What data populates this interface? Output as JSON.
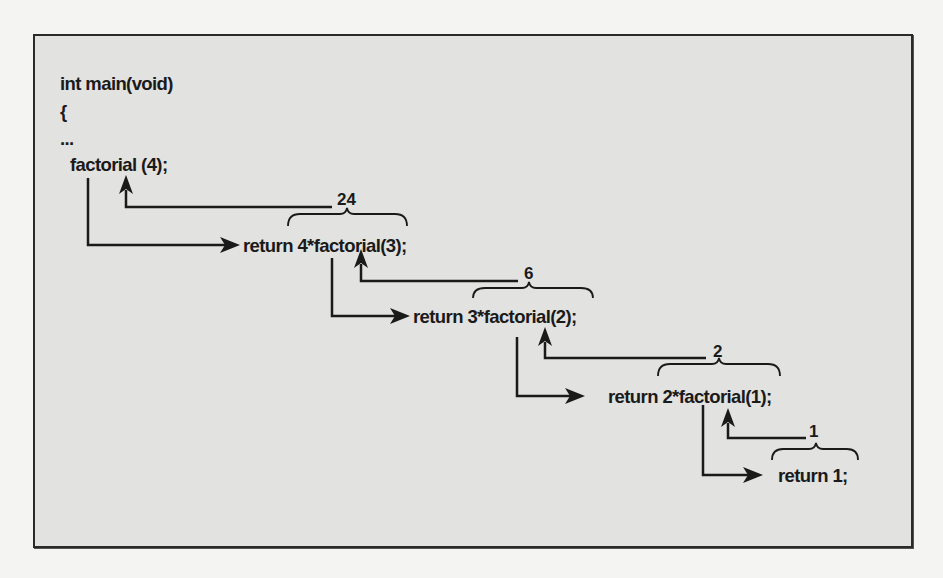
{
  "diagram": {
    "type": "recursion-call-trace",
    "colors": {
      "page_background": "#f4f4f2",
      "box_background": "#e2e2e0",
      "border": "#2a2a2a",
      "ink": "#1a1a1a"
    },
    "main_code": {
      "line1": "int main(void)",
      "line2": "{",
      "line3": "...",
      "line4": "factorial (4);"
    },
    "calls": [
      {
        "code": "return 4*factorial(3);",
        "returns": "24"
      },
      {
        "code": "return 3*factorial(2);",
        "returns": "6"
      },
      {
        "code": "return 2*factorial(1);",
        "returns": "2"
      },
      {
        "code": "return 1;",
        "returns": "1"
      }
    ]
  }
}
